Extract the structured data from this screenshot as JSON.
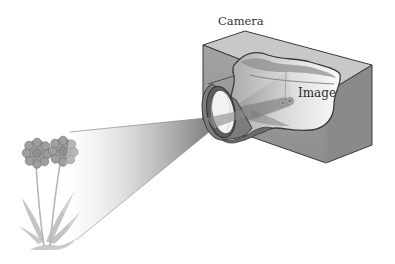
{
  "figure": {
    "labels": {
      "camera": "Camera",
      "image": "Image"
    },
    "colors": {
      "background": "#ffffff",
      "box_front": "#9a9a9a",
      "box_side": "#8c8c8c",
      "box_top": "#c4c4c4",
      "interior": "#e6e6e6",
      "flower": "#9b9b9b",
      "stem": "#b9b9b9",
      "cone": "#8a8a8a",
      "outline": "#3a3a3a"
    },
    "objects": [
      "flower-object",
      "light-cone",
      "lens",
      "camera-box",
      "inverted-image"
    ]
  }
}
